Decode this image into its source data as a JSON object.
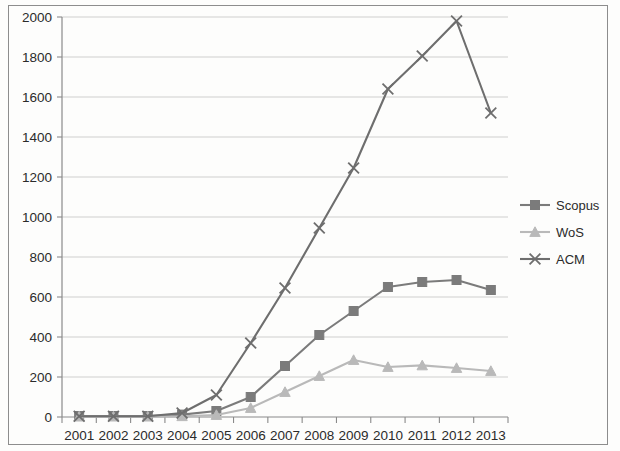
{
  "chart_data": {
    "type": "line",
    "title": "",
    "subtitle": "",
    "xlabel": "",
    "ylabel": "",
    "categories": [
      "2001",
      "2002",
      "2003",
      "2004",
      "2005",
      "2006",
      "2007",
      "2008",
      "2009",
      "2010",
      "2011",
      "2012",
      "2013"
    ],
    "x": [
      2001,
      2002,
      2003,
      2004,
      2005,
      2006,
      2007,
      2008,
      2009,
      2010,
      2011,
      2012,
      2013
    ],
    "ylim": [
      0,
      2000
    ],
    "ytick_labels": [
      "0",
      "200",
      "400",
      "600",
      "800",
      "1000",
      "1200",
      "1400",
      "1600",
      "1800",
      "2000"
    ],
    "ytick_values": [
      0,
      200,
      400,
      600,
      800,
      1000,
      1200,
      1400,
      1600,
      1800,
      2000
    ],
    "grid": true,
    "legend_position": "right",
    "series": [
      {
        "name": "Scopus",
        "marker": "square",
        "color": "#7b7b7b",
        "values": [
          5,
          5,
          5,
          12,
          30,
          100,
          255,
          410,
          530,
          650,
          675,
          685,
          635
        ]
      },
      {
        "name": "WoS",
        "marker": "triangle",
        "color": "#b9b9b9",
        "values": [
          2,
          2,
          2,
          4,
          10,
          45,
          125,
          205,
          285,
          250,
          258,
          245,
          230
        ]
      },
      {
        "name": "ACM",
        "marker": "x",
        "color": "#6e6e6e",
        "values": [
          4,
          4,
          4,
          20,
          110,
          370,
          645,
          945,
          1245,
          1640,
          1805,
          1980,
          1520
        ]
      }
    ]
  },
  "legend": {
    "items": [
      {
        "label": "Scopus"
      },
      {
        "label": "WoS"
      },
      {
        "label": "ACM"
      }
    ]
  },
  "axes": {
    "y_max_label": "2000",
    "y_min_label": "0"
  }
}
